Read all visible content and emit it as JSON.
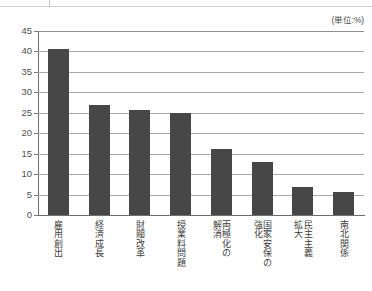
{
  "unit_caption": "(単位:%)",
  "chart_data": {
    "type": "bar",
    "title": "",
    "subtitle": "",
    "xlabel": "",
    "ylabel": "",
    "unit_note": "(単位:%)",
    "ylim": [
      0,
      45
    ],
    "ytick_step": 5,
    "yticks": [
      "45",
      "40",
      "35",
      "30",
      "25",
      "20",
      "15",
      "10",
      "5",
      "0"
    ],
    "ytick_values": [
      45,
      40,
      35,
      30,
      25,
      20,
      15,
      10,
      5,
      0
    ],
    "grid": true,
    "legend": false,
    "orientation": "vertical",
    "bar_color": "#474747",
    "categories": [
      "雇用創出",
      "経済成長",
      "財閥改革",
      "授業料問題",
      "両極化の解消",
      "国家安保の強化",
      "民主主義拡大",
      "南北関係"
    ],
    "category_columns": [
      [
        "雇用創出"
      ],
      [
        "経済成長"
      ],
      [
        "財閥改革"
      ],
      [
        "授業料問題"
      ],
      [
        "両極化の",
        "解消"
      ],
      [
        "国家安保の",
        "強化"
      ],
      [
        "民主主義",
        "拡大"
      ],
      [
        "南北関係"
      ]
    ],
    "values": [
      40.6,
      27.0,
      25.8,
      24.9,
      16.2,
      12.9,
      6.9,
      5.7
    ]
  }
}
